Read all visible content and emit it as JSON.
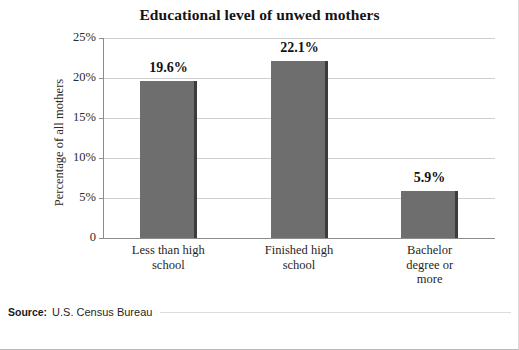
{
  "chart_data": {
    "type": "bar",
    "title": "Educational level of unwed mothers",
    "xlabel": "",
    "ylabel": "Percentage of all mothers",
    "categories": [
      "Less than high school",
      "Finished high school",
      "Bachelor degree or more"
    ],
    "category_lines": [
      [
        "Less than high",
        "school"
      ],
      [
        "Finished high",
        "school"
      ],
      [
        "Bachelor",
        "degree or",
        "more"
      ]
    ],
    "values": [
      19.6,
      22.1,
      5.9
    ],
    "value_labels": [
      "19.6%",
      "22.1%",
      "5.9%"
    ],
    "ylim": [
      0,
      25
    ],
    "yticks": [
      0,
      5,
      10,
      15,
      20,
      25
    ],
    "ytick_labels": [
      "0",
      "5%",
      "10%",
      "15%",
      "20%",
      "25%"
    ],
    "grid": true,
    "legend": "none",
    "bar_color": "#6e6e6e",
    "bar_edge_color": "#3c3c3c",
    "gridline_color": "#cfcfcf",
    "axis_color": "#8d8d8d"
  },
  "footer": {
    "source_label": "Source:",
    "source_text": "U.S. Census Bureau"
  }
}
